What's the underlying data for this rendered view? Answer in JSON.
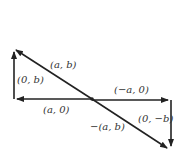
{
  "diagram": {
    "vectors": [
      {
        "id": "diag-up",
        "label": "(a, b)",
        "from": "center",
        "to": "top-left"
      },
      {
        "id": "vert-left",
        "label": "(0, b)",
        "from": "bottom-left",
        "to": "top-left"
      },
      {
        "id": "horiz-left",
        "label": "(a, 0)",
        "from": "center",
        "to": "bottom-left"
      },
      {
        "id": "horiz-right",
        "label": "(−a, 0)",
        "from": "center",
        "to": "mid-right"
      },
      {
        "id": "vert-right",
        "label": "(0, −b)",
        "from": "mid-right",
        "to": "bottom-right"
      },
      {
        "id": "diag-down",
        "label": "−(a, b)",
        "from": "center",
        "to": "bottom-right"
      }
    ],
    "stroke_color": "#222222"
  }
}
